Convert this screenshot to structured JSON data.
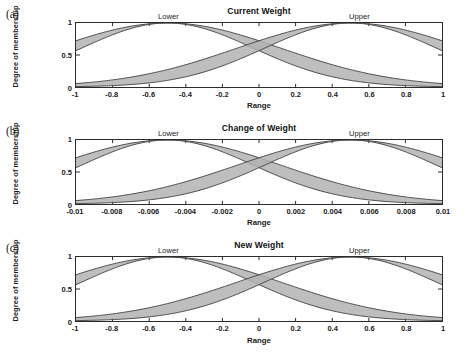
{
  "figure": {
    "background": "#ffffff",
    "band_fill": "#b3b3b3",
    "band_stroke": "#4d4d4d",
    "axis_color": "#2b2b2b"
  },
  "panels": [
    {
      "tag": "(a)",
      "title": "Current Weight",
      "ylabel": "Degree of membership",
      "xlabel": "Range",
      "labels": {
        "lower": "Lower",
        "upper": "Upper"
      },
      "yticks": [
        "1",
        "0.5",
        "0"
      ],
      "xticks": [
        "-1",
        "-0.8",
        "-0.6",
        "-0.4",
        "-0.2",
        "0",
        "0.2",
        "0.4",
        "0.6",
        "0.8",
        "1"
      ]
    },
    {
      "tag": "(b)",
      "title": "Change of Weight",
      "ylabel": "Degree of membership",
      "xlabel": "Range",
      "labels": {
        "lower": "Lower",
        "upper": "Upper"
      },
      "yticks": [
        "1",
        "0.5",
        "0"
      ],
      "xticks": [
        "-0.01",
        "-0.008",
        "-0.006",
        "-0.004",
        "-0.002",
        "0",
        "0.002",
        "0.004",
        "0.006",
        "0.008",
        "0.01"
      ]
    },
    {
      "tag": "(c)",
      "title": "New Weight",
      "ylabel": "Degree of membership",
      "xlabel": "Range",
      "labels": {
        "lower": "Lower",
        "upper": "Upper"
      },
      "yticks": [
        "1",
        "0.5",
        "0"
      ],
      "xticks": [
        "-1",
        "-0.8",
        "-0.6",
        "-0.4",
        "-0.2",
        "0",
        "0.2",
        "0.4",
        "0.6",
        "0.8",
        "1"
      ]
    }
  ],
  "chart_data": {
    "type": "area",
    "xlabel": "Range",
    "ylabel": "Degree of membership",
    "ylim": [
      0,
      1
    ],
    "yticks": [
      0,
      0.5,
      1
    ],
    "grid": false,
    "legend_position": "inline-annotations",
    "panels": [
      {
        "tag": "(a)",
        "title": "Current Weight",
        "xlim": [
          -1,
          1
        ],
        "xticks": [
          -1,
          -0.8,
          -0.6,
          -0.4,
          -0.2,
          0,
          0.2,
          0.4,
          0.6,
          0.8,
          1
        ],
        "series": [
          {
            "name": "Lower",
            "type": "gaussian-band",
            "center": -0.5,
            "sigma_upper": 0.62,
            "sigma_lower": 0.47,
            "peak": 1.0,
            "value_at_left_edge": [
              0.75,
              0.5
            ],
            "value_at_right_edge": [
              0.05,
              0.01
            ]
          },
          {
            "name": "Upper",
            "type": "gaussian-band",
            "center": 0.5,
            "sigma_upper": 0.62,
            "sigma_lower": 0.47,
            "peak": 1.0,
            "value_at_left_edge": [
              0.05,
              0.01
            ],
            "value_at_right_edge": [
              0.75,
              0.5
            ]
          }
        ],
        "crossing_point": {
          "x": 0.0,
          "y_range": [
            0.53,
            0.72
          ]
        }
      },
      {
        "tag": "(b)",
        "title": "Change of Weight",
        "xlim": [
          -0.01,
          0.01
        ],
        "xticks": [
          -0.01,
          -0.008,
          -0.006,
          -0.004,
          -0.002,
          0,
          0.002,
          0.004,
          0.006,
          0.008,
          0.01
        ],
        "series": [
          {
            "name": "Lower",
            "type": "gaussian-band",
            "center": -0.005,
            "sigma_upper": 0.0062,
            "sigma_lower": 0.0047,
            "peak": 1.0,
            "value_at_left_edge": [
              0.75,
              0.5
            ],
            "value_at_right_edge": [
              0.05,
              0.01
            ]
          },
          {
            "name": "Upper",
            "type": "gaussian-band",
            "center": 0.005,
            "sigma_upper": 0.0062,
            "sigma_lower": 0.0047,
            "peak": 1.0,
            "value_at_left_edge": [
              0.05,
              0.01
            ],
            "value_at_right_edge": [
              0.75,
              0.5
            ]
          }
        ],
        "crossing_point": {
          "x": 0.0,
          "y_range": [
            0.53,
            0.72
          ]
        }
      },
      {
        "tag": "(c)",
        "title": "New Weight",
        "xlim": [
          -1,
          1
        ],
        "xticks": [
          -1,
          -0.8,
          -0.6,
          -0.4,
          -0.2,
          0,
          0.2,
          0.4,
          0.6,
          0.8,
          1
        ],
        "series": [
          {
            "name": "Lower",
            "type": "gaussian-band",
            "center": -0.5,
            "sigma_upper": 0.62,
            "sigma_lower": 0.47,
            "peak": 1.0,
            "value_at_left_edge": [
              0.75,
              0.5
            ],
            "value_at_right_edge": [
              0.05,
              0.01
            ]
          },
          {
            "name": "Upper",
            "type": "gaussian-band",
            "center": 0.5,
            "sigma_upper": 0.62,
            "sigma_lower": 0.47,
            "peak": 1.0,
            "value_at_left_edge": [
              0.05,
              0.01
            ],
            "value_at_right_edge": [
              0.75,
              0.5
            ]
          }
        ],
        "crossing_point": {
          "x": 0.0,
          "y_range": [
            0.53,
            0.72
          ]
        }
      }
    ]
  }
}
